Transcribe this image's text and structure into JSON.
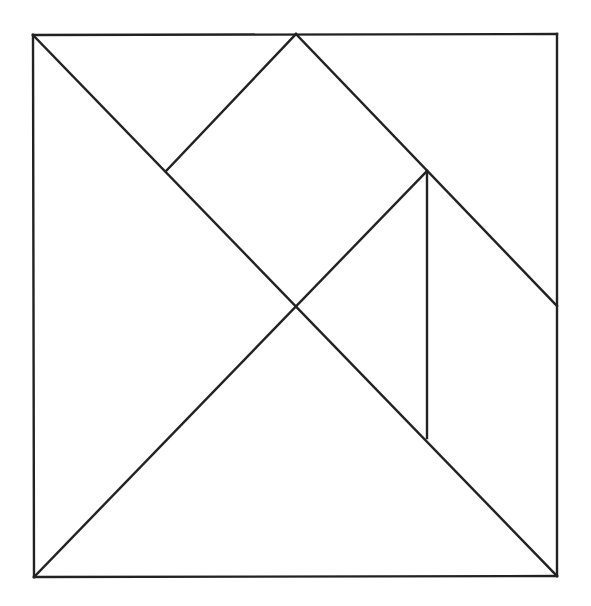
{
  "diagram": {
    "type": "tangram",
    "stroke_color": "#222222",
    "background_color": "#ffffff",
    "stroke_width": 2.4,
    "points": {
      "TL": [
        33,
        35
      ],
      "TM": [
        296,
        34
      ],
      "TR": [
        557,
        34
      ],
      "L1": [
        166,
        171
      ],
      "R1": [
        427,
        171
      ],
      "C": [
        296,
        306
      ],
      "RE": [
        557,
        306
      ],
      "R2": [
        427,
        438
      ],
      "BL": [
        34,
        577
      ],
      "BR": [
        557,
        576
      ]
    },
    "segments": [
      {
        "name": "outer-top-edge",
        "from": "TL",
        "to": "TR"
      },
      {
        "name": "outer-right-edge",
        "from": "TR",
        "to": "BR"
      },
      {
        "name": "outer-bottom-edge",
        "from": "BR",
        "to": "BL"
      },
      {
        "name": "outer-left-edge",
        "from": "BL",
        "to": "TL"
      },
      {
        "name": "main-diagonal",
        "from": "TL",
        "to": "BR"
      },
      {
        "name": "anti-diagonal-lower",
        "from": "BL",
        "to": "R1"
      },
      {
        "name": "square-upper-left-edge",
        "from": "L1",
        "to": "TM"
      },
      {
        "name": "parallelogram-upper-edge",
        "from": "TM",
        "to": "RE"
      },
      {
        "name": "small-triangle-vertical-edge",
        "from": "R1",
        "to": "R2"
      }
    ],
    "pieces": [
      {
        "name": "large-triangle-left",
        "vertices": [
          "TL",
          "C",
          "BL"
        ]
      },
      {
        "name": "large-triangle-bottom",
        "vertices": [
          "BL",
          "C",
          "BR"
        ]
      },
      {
        "name": "medium-triangle-top-left",
        "vertices": [
          "TL",
          "TM",
          "L1"
        ]
      },
      {
        "name": "square",
        "vertices": [
          "L1",
          "TM",
          "R1",
          "C"
        ]
      },
      {
        "name": "small-triangle-middle",
        "vertices": [
          "C",
          "R1",
          "R2"
        ]
      },
      {
        "name": "parallelogram-right",
        "vertices": [
          "R1",
          "RE",
          "BR",
          "R2"
        ]
      },
      {
        "name": "small-triangle-top-right",
        "vertices": [
          "TM",
          "TR",
          "RE"
        ]
      }
    ]
  }
}
